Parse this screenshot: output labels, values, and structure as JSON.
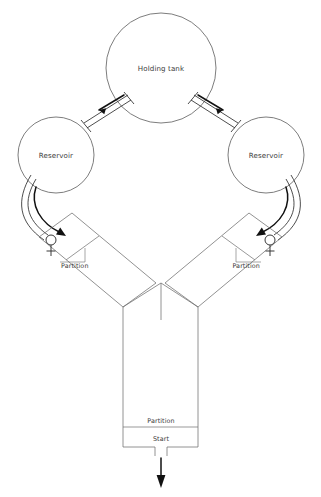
{
  "diagram": {
    "title_text": "Y-maze flow apparatus",
    "background_color": "#ffffff",
    "line_color": "#5c5c5c",
    "tube_color": "#2e2e2e",
    "arrow_color": "#111111",
    "text_color": "#3a3a3a"
  },
  "holding_tank": {
    "label": "Holding tank",
    "shape": "circle",
    "center_x": 161,
    "center_y": 68,
    "radius": 55
  },
  "reservoirs": [
    {
      "id": "reservoir-left",
      "label": "Reservoir",
      "shape": "circle",
      "center_x": 56,
      "center_y": 155,
      "radius": 38
    },
    {
      "id": "reservoir-right",
      "label": "Reservoir",
      "shape": "circle",
      "center_x": 266,
      "center_y": 155,
      "radius": 38
    }
  ],
  "arms": [
    {
      "id": "arm-left",
      "partition_label": "Partition",
      "symbol": "female-symbol",
      "symbol_glyph": "♀",
      "side": "left"
    },
    {
      "id": "arm-right",
      "partition_label": "Partition",
      "symbol": "female-symbol",
      "symbol_glyph": "♀",
      "side": "right"
    }
  ],
  "start_chamber": {
    "partition_label": "Partition",
    "start_label": "Start"
  },
  "flow_arrows": [
    {
      "id": "flow-tank-to-left-reservoir",
      "direction": "down-left",
      "icon": "arrow-icon"
    },
    {
      "id": "flow-tank-to-right-reservoir",
      "direction": "down-right",
      "icon": "arrow-icon"
    },
    {
      "id": "flow-left-reservoir-to-arm",
      "direction": "down-curved",
      "icon": "arrow-icon"
    },
    {
      "id": "flow-right-reservoir-to-arm",
      "direction": "down-curved",
      "icon": "arrow-icon"
    },
    {
      "id": "flow-outlet",
      "direction": "down",
      "icon": "arrow-icon"
    }
  ]
}
